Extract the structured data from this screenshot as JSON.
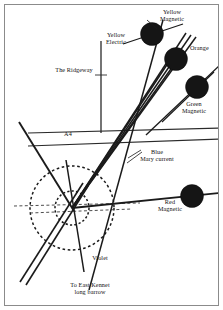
{
  "figure": {
    "kind": "ley-line-survey-map",
    "border_color": "#8b8b8b",
    "background": "#ffffff"
  },
  "labels": [
    {
      "name": "yellow-magnetic",
      "text": "Yellow\nMagnetic",
      "x": 148,
      "y": 8,
      "w": 48,
      "align": "center"
    },
    {
      "name": "yellow-electric",
      "text": "Yellow\nElectric",
      "x": 99,
      "y": 31,
      "w": 34,
      "align": "center"
    },
    {
      "name": "orange",
      "text": "Orange",
      "x": 190,
      "y": 44,
      "w": 30,
      "align": "left"
    },
    {
      "name": "the-ridgeway",
      "text": "The Ridgeway",
      "x": 47,
      "y": 66,
      "w": 54,
      "align": "center"
    },
    {
      "name": "green-magnetic",
      "text": "Green\nMagnetic",
      "x": 174,
      "y": 100,
      "w": 40,
      "align": "center"
    },
    {
      "name": "a4",
      "text": "A4",
      "x": 58,
      "y": 130,
      "w": 20,
      "align": "center"
    },
    {
      "name": "blue-mary-current",
      "text": "Blue\nMary current",
      "x": 130,
      "y": 148,
      "w": 54,
      "align": "center"
    },
    {
      "name": "red-magnetic",
      "text": "Red\nMagnetic",
      "x": 151,
      "y": 198,
      "w": 38,
      "align": "center"
    },
    {
      "name": "violet",
      "text": "Violet",
      "x": 88,
      "y": 254,
      "w": 24,
      "align": "center"
    },
    {
      "name": "to-east-kennet",
      "text": "To East Kennet\nlong barrow",
      "x": 58,
      "y": 281,
      "w": 64,
      "align": "center"
    }
  ],
  "nodes": [
    {
      "name": "node-yellow-magnetic",
      "cx": 152,
      "cy": 34,
      "r": 11.5,
      "color": "#151515"
    },
    {
      "name": "node-orange",
      "cx": 176,
      "cy": 59,
      "r": 11.5,
      "color": "#151515"
    },
    {
      "name": "node-green-magnetic",
      "cx": 197,
      "cy": 87,
      "r": 11.5,
      "color": "#151515"
    },
    {
      "name": "node-red-magnetic",
      "cx": 192,
      "cy": 196,
      "r": 11.5,
      "color": "#151515"
    }
  ],
  "hub": {
    "name": "convergence-point",
    "cx": 72,
    "cy": 208
  },
  "rings": [
    {
      "name": "ring-outer",
      "cx": 72,
      "cy": 208,
      "r": 42,
      "dash": "2.6 2.6"
    },
    {
      "name": "ring-inner",
      "cx": 72,
      "cy": 208,
      "r": 17,
      "dash": "2.2 2.2"
    }
  ],
  "lines": {
    "roads": [
      {
        "name": "road-ridgeway-vertical",
        "x1": 101,
        "y1": 41,
        "x2": 101,
        "y2": 133,
        "w": 1.3
      },
      {
        "name": "road-a4-upper",
        "x1": 28,
        "y1": 133,
        "x2": 220,
        "y2": 128,
        "w": 1.2
      },
      {
        "name": "road-a4-lower",
        "x1": 28,
        "y1": 146,
        "x2": 220,
        "y2": 139,
        "w": 1.2
      },
      {
        "name": "road-ridgeway-tick",
        "x1": 95,
        "y1": 75,
        "x2": 107,
        "y2": 75,
        "w": 0.9
      }
    ],
    "energy": [
      {
        "name": "line-yellow-electric",
        "x1": 89,
        "y1": 290,
        "x2": 163,
        "y2": 20,
        "w": 1.5
      },
      {
        "name": "line-yellow-magnetic",
        "x1": 123,
        "y1": 44,
        "x2": 183,
        "y2": 24,
        "w": 1.3
      },
      {
        "name": "line-orange-1",
        "x1": 72,
        "y1": 208,
        "x2": 186,
        "y2": 33,
        "w": 1.5
      },
      {
        "name": "line-orange-2",
        "x1": 72,
        "y1": 208,
        "x2": 191,
        "y2": 35,
        "w": 1.5
      },
      {
        "name": "line-orange-3",
        "x1": 72,
        "y1": 208,
        "x2": 196,
        "y2": 37,
        "w": 1.5
      },
      {
        "name": "line-blue-mary-1",
        "x1": 72,
        "y1": 208,
        "x2": 178,
        "y2": 48,
        "w": 1.6
      },
      {
        "name": "line-blue-mary-2",
        "x1": 72,
        "y1": 208,
        "x2": 183,
        "y2": 52,
        "w": 1.6
      },
      {
        "name": "line-green-magnetic",
        "x1": 146,
        "y1": 135,
        "x2": 221,
        "y2": 64,
        "w": 1.4
      },
      {
        "name": "line-green-magnetic-2",
        "x1": 162,
        "y1": 122,
        "x2": 214,
        "y2": 72,
        "w": 1.2
      },
      {
        "name": "line-red-magnetic",
        "x1": 72,
        "y1": 208,
        "x2": 220,
        "y2": 193,
        "w": 1.8
      },
      {
        "name": "line-violet",
        "x1": 66,
        "y1": 160,
        "x2": 84,
        "y2": 272,
        "w": 1.5
      },
      {
        "name": "line-northwest-1",
        "x1": 19,
        "y1": 122,
        "x2": 74,
        "y2": 211,
        "w": 1.9
      },
      {
        "name": "line-southwest-1",
        "x1": 20,
        "y1": 282,
        "x2": 83,
        "y2": 183,
        "w": 1.6
      },
      {
        "name": "line-southwest-2",
        "x1": 26,
        "y1": 285,
        "x2": 88,
        "y2": 186,
        "w": 1.6
      },
      {
        "name": "line-hub-horizontal-dash",
        "x1": 14,
        "y1": 206,
        "x2": 140,
        "y2": 203,
        "w": 0.9
      },
      {
        "name": "line-hub-horizontal-dash-2",
        "x1": 30,
        "y1": 213,
        "x2": 132,
        "y2": 209,
        "w": 0.9
      }
    ]
  },
  "leaders": [
    {
      "name": "leader-yellow-magnetic",
      "x1": 147,
      "y1": 20,
      "x2": 157,
      "y2": 29
    },
    {
      "name": "leader-blue",
      "x1": 128,
      "y1": 158,
      "x2": 141,
      "y2": 150
    },
    {
      "name": "leader-mary",
      "x1": 127,
      "y1": 163,
      "x2": 142,
      "y2": 152
    }
  ]
}
